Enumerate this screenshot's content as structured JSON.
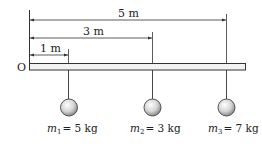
{
  "origin_label": "O",
  "dimensions": [
    {
      "label": "5 m",
      "distance": 5
    },
    {
      "label": "3 m",
      "distance": 3
    },
    {
      "label": "1 m",
      "distance": 1
    }
  ],
  "masses": [
    {
      "symbol": "m",
      "subscript": "1",
      "value_text": "= 5 kg",
      "position_m": 1,
      "mass_kg": 5
    },
    {
      "symbol": "m",
      "subscript": "2",
      "value_text": "= 3 kg",
      "position_m": 3,
      "mass_kg": 3
    },
    {
      "symbol": "m",
      "subscript": "3",
      "value_text": "= 7 kg",
      "position_m": 5,
      "mass_kg": 7
    }
  ],
  "colors": {
    "line": "#333333",
    "bar_fill": "#f2f2f2",
    "ball_fill": "#d8d8d8"
  }
}
